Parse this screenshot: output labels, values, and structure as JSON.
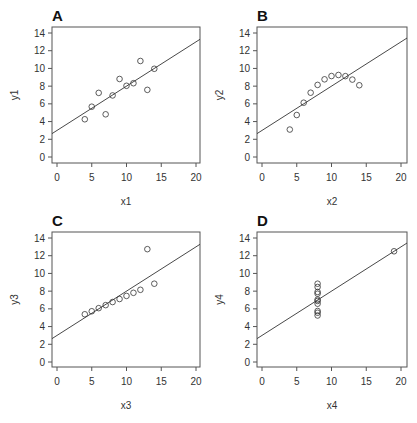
{
  "chart_data": [
    {
      "type": "scatter",
      "title": "A",
      "xlabel": "x1",
      "ylabel": "y1",
      "xlim": [
        0,
        20
      ],
      "ylim": [
        0,
        14
      ],
      "xticks": [
        0,
        5,
        10,
        15,
        20
      ],
      "yticks": [
        0,
        2,
        4,
        6,
        8,
        10,
        12,
        14
      ],
      "grid": false,
      "x": [
        10,
        8,
        13,
        9,
        11,
        14,
        6,
        4,
        12,
        7,
        5
      ],
      "y": [
        8.04,
        6.95,
        7.58,
        8.81,
        8.33,
        9.96,
        7.24,
        4.26,
        10.84,
        4.82,
        5.68
      ],
      "fit_line": {
        "intercept": 3.0,
        "slope": 0.5
      }
    },
    {
      "type": "scatter",
      "title": "B",
      "xlabel": "x2",
      "ylabel": "y2",
      "xlim": [
        0,
        20
      ],
      "ylim": [
        0,
        14
      ],
      "xticks": [
        0,
        5,
        10,
        15,
        20
      ],
      "yticks": [
        0,
        2,
        4,
        6,
        8,
        10,
        12,
        14
      ],
      "grid": false,
      "x": [
        10,
        8,
        13,
        9,
        11,
        14,
        6,
        4,
        12,
        7,
        5
      ],
      "y": [
        9.14,
        8.14,
        8.74,
        8.77,
        9.26,
        8.1,
        6.13,
        3.1,
        9.13,
        7.26,
        4.74
      ],
      "fit_line": {
        "intercept": 3.0,
        "slope": 0.5
      }
    },
    {
      "type": "scatter",
      "title": "C",
      "xlabel": "x3",
      "ylabel": "y3",
      "xlim": [
        0,
        20
      ],
      "ylim": [
        0,
        14
      ],
      "xticks": [
        0,
        5,
        10,
        15,
        20
      ],
      "yticks": [
        0,
        2,
        4,
        6,
        8,
        10,
        12,
        14
      ],
      "grid": false,
      "x": [
        10,
        8,
        13,
        9,
        11,
        14,
        6,
        4,
        12,
        7,
        5
      ],
      "y": [
        7.46,
        6.77,
        12.74,
        7.11,
        7.81,
        8.84,
        6.08,
        5.39,
        8.15,
        6.42,
        5.73
      ],
      "fit_line": {
        "intercept": 3.0,
        "slope": 0.5
      }
    },
    {
      "type": "scatter",
      "title": "D",
      "xlabel": "x4",
      "ylabel": "y4",
      "xlim": [
        0,
        20
      ],
      "ylim": [
        0,
        14
      ],
      "xticks": [
        0,
        5,
        10,
        15,
        20
      ],
      "yticks": [
        0,
        2,
        4,
        6,
        8,
        10,
        12,
        14
      ],
      "grid": false,
      "x": [
        8,
        8,
        8,
        8,
        8,
        8,
        8,
        19,
        8,
        8,
        8
      ],
      "y": [
        6.58,
        5.76,
        7.71,
        8.84,
        8.47,
        7.04,
        5.25,
        12.5,
        5.56,
        7.91,
        6.89
      ],
      "fit_line": {
        "intercept": 3.0,
        "slope": 0.5
      }
    }
  ],
  "layout": {
    "panels": [
      {
        "left": 52,
        "top": 27,
        "right": 200,
        "bottom": 163
      },
      {
        "left": 257,
        "top": 27,
        "right": 407,
        "bottom": 163
      },
      {
        "left": 52,
        "top": 232,
        "right": 200,
        "bottom": 367
      },
      {
        "left": 257,
        "top": 232,
        "right": 407,
        "bottom": 367
      }
    ],
    "colors": {
      "axis": "#555555",
      "point": "#333333",
      "line": "#333333"
    }
  }
}
